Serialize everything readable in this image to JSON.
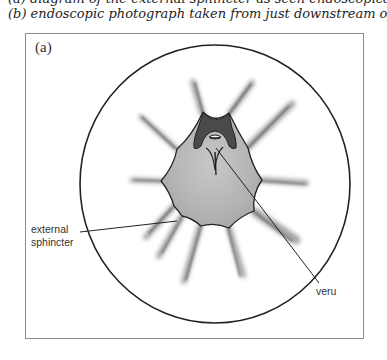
{
  "caption": {
    "line1": "(a) diagram of the external sphincter as seen endoscopically and",
    "line2": "(b) endoscopic photograph taken from just downstream of the sphincter."
  },
  "figure": {
    "panel_label": "(a)",
    "annotations": {
      "external_sphincter": [
        "external",
        "sphincter"
      ],
      "veru": "veru"
    },
    "colors": {
      "outline": "#222222",
      "lumen_fill": "#b9b9b9",
      "dark_region": "#4a4a4a",
      "frame": "#8a8a8a"
    }
  }
}
